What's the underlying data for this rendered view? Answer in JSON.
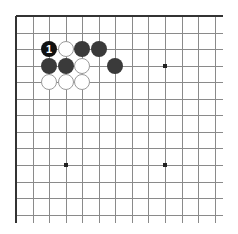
{
  "board": {
    "origin_x": 16,
    "origin_y": 16,
    "spacing": 16.55,
    "cols_visible": 13,
    "rows_visible": 13,
    "line_extend": 8,
    "edges_shown": [
      "top",
      "left"
    ],
    "colors": {
      "line": "#8a8a8a",
      "border": "#333333",
      "black_stone": "#3a3a3a",
      "numbered_stone": "#111111",
      "white_stone": "#ffffff",
      "white_outline": "#9a9a9a",
      "number_text": "#ffffff"
    }
  },
  "star_points": [
    {
      "col": 9,
      "row": 3
    },
    {
      "col": 3,
      "row": 9
    },
    {
      "col": 9,
      "row": 9
    }
  ],
  "stones": [
    {
      "color": "black",
      "col": 2,
      "row": 2,
      "label": "1"
    },
    {
      "color": "white",
      "col": 3,
      "row": 2,
      "label": ""
    },
    {
      "color": "black",
      "col": 4,
      "row": 2,
      "label": ""
    },
    {
      "color": "black",
      "col": 5,
      "row": 2,
      "label": ""
    },
    {
      "color": "black",
      "col": 2,
      "row": 3,
      "label": ""
    },
    {
      "color": "black",
      "col": 3,
      "row": 3,
      "label": ""
    },
    {
      "color": "white",
      "col": 4,
      "row": 3,
      "label": ""
    },
    {
      "color": "black",
      "col": 6,
      "row": 3,
      "label": ""
    },
    {
      "color": "white",
      "col": 2,
      "row": 4,
      "label": ""
    },
    {
      "color": "white",
      "col": 3,
      "row": 4,
      "label": ""
    },
    {
      "color": "white",
      "col": 4,
      "row": 4,
      "label": ""
    }
  ]
}
